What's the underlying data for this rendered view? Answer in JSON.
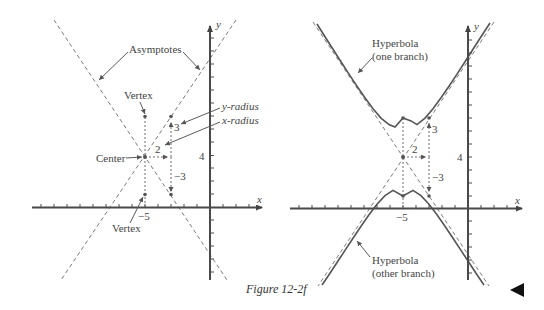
{
  "figure": {
    "caption": "Figure 12-2f",
    "back_button_icon": "triangle-left-icon"
  },
  "left_panel": {
    "axis_x_label": "x",
    "axis_y_label": "y",
    "tick_label_x": "−5",
    "tick_label_y": "4",
    "annotations": {
      "asymptotes": "Asymptotes",
      "vertex_top": "Vertex",
      "vertex_bottom": "Vertex",
      "center": "Center",
      "y_radius": "y-radius",
      "x_radius": "x-radius",
      "value_up": "3",
      "value_right": "2",
      "value_down": "−3"
    }
  },
  "right_panel": {
    "axis_x_label": "x",
    "axis_y_label": "y",
    "tick_label_x": "−5",
    "tick_label_y": "4",
    "annotations": {
      "one_branch_line1": "Hyperbola",
      "one_branch_line2": "(one branch)",
      "other_branch_line1": "Hyperbola",
      "other_branch_line2": "(other branch)",
      "value_up": "3",
      "value_right": "2",
      "value_down": "−3"
    }
  },
  "math": {
    "center": [
      -5,
      4
    ],
    "x_radius": 2,
    "y_radius": 3,
    "asymptote_slope": 1.5,
    "equation": "(y-4)^2/9 - (x+5)^2/4 = 1"
  }
}
